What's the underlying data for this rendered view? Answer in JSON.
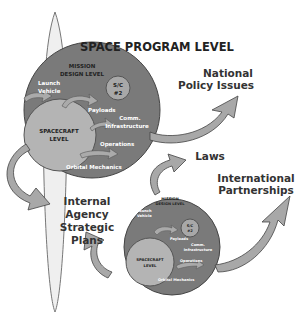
{
  "title": "SPACE PROGRAM LEVEL",
  "external_labels": {
    "national_policy": [
      "National",
      "Policy Issues"
    ],
    "laws": "Laws",
    "international": [
      "International",
      "Partnerships"
    ],
    "internal_agency": [
      "Internal",
      "Agency",
      "Strategic",
      "Plans"
    ]
  },
  "program_circle_large": {
    "mission_design": [
      "MISSION",
      "DESIGN LEVEL"
    ],
    "launch_vehicle": [
      "Launch",
      "Vehicle"
    ],
    "sc2": [
      "S/C",
      "#2"
    ],
    "payloads": "Payloads",
    "comm": [
      "Comm.",
      "Infrastructure"
    ],
    "operations": "Operations",
    "orbital": "Orbital Mechanics",
    "spacecraft": [
      "SPACECRAFT",
      "LEVEL"
    ]
  },
  "program_circle_small": {
    "mission_design": [
      "MISSION",
      "DESIGN LEVEL"
    ],
    "launch_vehicle": [
      "Launch",
      "Vehicle"
    ],
    "sc2": [
      "S/C",
      "#2"
    ],
    "payloads": "Payloads",
    "comm": [
      "Comm.",
      "Infrastructure"
    ],
    "operations": "Operations",
    "orbital": "Orbital Mechanics",
    "spacecraft": [
      "SPACECRAFT",
      "LEVEL"
    ]
  },
  "colors": {
    "outer_circle": "#7a7a7a",
    "inner_circle": "#b4b4b4",
    "arrow": "#a8a8a8",
    "ellipse": "#eeeeee",
    "text_dark": "#222222",
    "text_light": "#ffffff"
  }
}
